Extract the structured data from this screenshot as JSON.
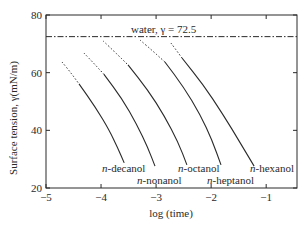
{
  "chart_data": {
    "type": "line",
    "title": "",
    "xlabel": "log (time)",
    "ylabel": "Surface tension, γ(mN/m)",
    "xlim": [
      -5,
      -0.44
    ],
    "ylim": [
      20,
      80
    ],
    "grid": false,
    "xticks": [
      -5,
      -4,
      -3,
      -2,
      -1
    ],
    "xtick_labels": [
      "−5",
      "−4",
      "−3",
      "−2",
      "−1"
    ],
    "yticks": [
      20,
      40,
      60,
      80
    ],
    "ytick_labels": [
      "20",
      "40",
      "60",
      "80"
    ],
    "reference_line": {
      "label": "water, γ = 72.5",
      "y": 72.5,
      "style": "dash-dot"
    },
    "series": [
      {
        "name": "n-decanol",
        "label_prefix": "n",
        "label_suffix": "-decanol",
        "dashed": [
          [
            -4.71,
            63.7
          ],
          [
            -4.55,
            60.0
          ],
          [
            -4.4,
            56.1
          ]
        ],
        "solid": [
          [
            -4.4,
            56.1
          ],
          [
            -4.1,
            48.0
          ],
          [
            -3.85,
            40.0
          ],
          [
            -3.7,
            34.0
          ],
          [
            -3.58,
            28.7
          ]
        ],
        "label_pos": [
          102,
          172
        ]
      },
      {
        "name": "n-nonanol",
        "label_prefix": "n",
        "label_suffix": "-nonanol",
        "dashed": [
          [
            -4.31,
            66.8
          ],
          [
            -4.13,
            63.2
          ],
          [
            -3.95,
            59.5
          ]
        ],
        "solid": [
          [
            -3.95,
            59.5
          ],
          [
            -3.62,
            51.0
          ],
          [
            -3.35,
            42.0
          ],
          [
            -3.15,
            34.0
          ],
          [
            -3.02,
            27.6
          ]
        ],
        "label_pos": [
          137,
          184
        ]
      },
      {
        "name": "n-octanol",
        "label_prefix": "n",
        "label_suffix": "-octanol",
        "dashed": [
          [
            -3.96,
            71.0
          ],
          [
            -3.73,
            66.8
          ],
          [
            -3.51,
            62.7
          ]
        ],
        "solid": [
          [
            -3.51,
            62.7
          ],
          [
            -3.15,
            54.0
          ],
          [
            -2.85,
            45.0
          ],
          [
            -2.6,
            36.0
          ],
          [
            -2.44,
            28.0
          ]
        ],
        "label_pos": [
          178,
          172
        ]
      },
      {
        "name": "n-heptanol",
        "label_prefix": "n",
        "label_suffix": "-heptanol",
        "dashed": [
          [
            -3.29,
            71.3
          ],
          [
            -3.06,
            67.5
          ],
          [
            -2.84,
            63.7
          ]
        ],
        "solid": [
          [
            -2.84,
            63.7
          ],
          [
            -2.5,
            55.0
          ],
          [
            -2.2,
            45.5
          ],
          [
            -1.98,
            36.5
          ],
          [
            -1.82,
            28.0
          ]
        ],
        "label_pos": [
          207,
          184
        ]
      },
      {
        "name": "n-hexanol",
        "label_prefix": "n",
        "label_suffix": "-hexanol",
        "dashed": [
          [
            -2.73,
            70.3
          ],
          [
            -2.63,
            67.7
          ],
          [
            -2.53,
            65.1
          ]
        ],
        "solid": [
          [
            -2.53,
            65.1
          ],
          [
            -2.15,
            56.0
          ],
          [
            -1.8,
            46.0
          ],
          [
            -1.45,
            35.0
          ],
          [
            -1.22,
            27.6
          ]
        ],
        "label_pos": [
          250,
          172
        ]
      }
    ]
  },
  "plot_area": {
    "left": 46,
    "top": 15,
    "right": 297,
    "bottom": 188
  },
  "colors": {
    "ink": "#2a2a2a",
    "background": "#ffffff"
  }
}
